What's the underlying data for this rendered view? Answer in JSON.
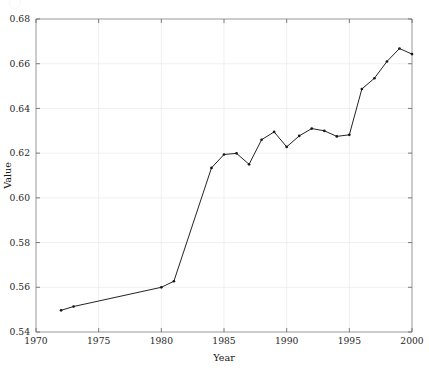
{
  "figure": {
    "background_color": "#ffffff",
    "plot_area": {
      "left": 36,
      "top": 19,
      "right": 412,
      "bottom": 332
    }
  },
  "chart_data": {
    "type": "line",
    "title": "",
    "xlabel": "Year",
    "ylabel": "Value",
    "xlim": [
      1970,
      2000
    ],
    "ylim": [
      0.54,
      0.68
    ],
    "grid": true,
    "legend": null,
    "line_color": "#17171a",
    "marker": "point",
    "marker_color": "#17171a",
    "xticks": [
      1970,
      1975,
      1980,
      1985,
      1990,
      1995,
      2000
    ],
    "xtick_labels": [
      "1970",
      "1975",
      "1980",
      "1985",
      "1990",
      "1995",
      "2000"
    ],
    "yticks": [
      0.54,
      0.56,
      0.58,
      0.6,
      0.62,
      0.64,
      0.66,
      0.68
    ],
    "ytick_labels": [
      "0.54",
      "0.56",
      "0.58",
      "0.60",
      "0.62",
      "0.64",
      "0.66",
      "0.68"
    ],
    "x": [
      1972,
      1973,
      1980,
      1981,
      1984,
      1985,
      1986,
      1987,
      1988,
      1989,
      1990,
      1991,
      1992,
      1993,
      1994,
      1995,
      1996,
      1997,
      1998,
      1999,
      2000
    ],
    "values": [
      0.5497,
      0.5514,
      0.56,
      0.5627,
      0.6134,
      0.6194,
      0.6199,
      0.615,
      0.626,
      0.6295,
      0.6228,
      0.6277,
      0.631,
      0.63,
      0.6275,
      0.6282,
      0.6487,
      0.6535,
      0.661,
      0.6668,
      0.6643
    ]
  }
}
